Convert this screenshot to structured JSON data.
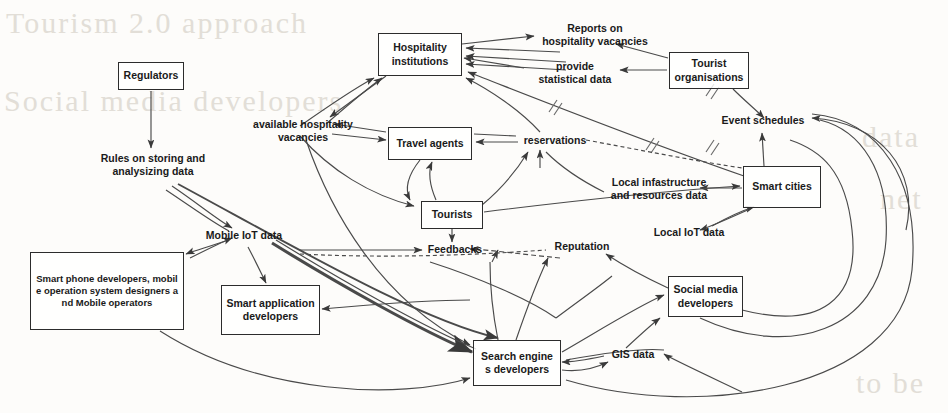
{
  "diagram": {
    "type": "node-link-diagram",
    "canvas": {
      "width": 948,
      "height": 413
    },
    "style": {
      "box_border": "#2c2c2c",
      "line_color": "#4a4a4a",
      "text_color": "#1a1a1a",
      "background": "#fdfcfa"
    },
    "nodes": [
      {
        "id": "regulators",
        "label": "Regulators",
        "x": 118,
        "y": 62,
        "w": 66,
        "h": 28
      },
      {
        "id": "hospitality",
        "label": "Hospitality\ninstitutions",
        "x": 378,
        "y": 33,
        "w": 84,
        "h": 43
      },
      {
        "id": "tourist_org",
        "label": "Tourist\norganisations",
        "x": 669,
        "y": 52,
        "w": 80,
        "h": 37
      },
      {
        "id": "travel",
        "label": "Travel agents",
        "x": 388,
        "y": 127,
        "w": 84,
        "h": 33
      },
      {
        "id": "tourists",
        "label": "Tourists",
        "x": 421,
        "y": 201,
        "w": 62,
        "h": 28
      },
      {
        "id": "smart_cities",
        "label": "Smart cities",
        "x": 743,
        "y": 166,
        "w": 78,
        "h": 42
      },
      {
        "id": "smartphone",
        "label": "Smart phone developers, mobil\ne operation system designers a\nnd Mobile operators",
        "x": 30,
        "y": 252,
        "w": 154,
        "h": 78
      },
      {
        "id": "smart_app",
        "label": "Smart application\ndevelopers",
        "x": 221,
        "y": 285,
        "w": 99,
        "h": 50
      },
      {
        "id": "social_media",
        "label": "Social media\ndevelopers",
        "x": 668,
        "y": 276,
        "w": 75,
        "h": 41
      },
      {
        "id": "search_eng",
        "label": "Search engine\ns developers",
        "x": 473,
        "y": 340,
        "w": 88,
        "h": 46
      }
    ],
    "flow_labels": [
      {
        "id": "reports",
        "text": "Reports on\nhospitality vacancies",
        "x": 532,
        "y": 22,
        "w": 126
      },
      {
        "id": "provide_stats",
        "text": "provide\nstatistical data",
        "x": 527,
        "y": 60,
        "w": 96
      },
      {
        "id": "avail_vac",
        "text": "available hospitality\nvacancies",
        "x": 240,
        "y": 118,
        "w": 126
      },
      {
        "id": "event_sched",
        "text": "Event schedules",
        "x": 718,
        "y": 114,
        "w": 90
      },
      {
        "id": "reservations",
        "text": "reservations",
        "x": 519,
        "y": 134,
        "w": 72
      },
      {
        "id": "rules",
        "text": "Rules on storing and\nanalysizing data",
        "x": 88,
        "y": 152,
        "w": 130
      },
      {
        "id": "local_infra",
        "text": "Local infastructure\nand resources data",
        "x": 600,
        "y": 176,
        "w": 118
      },
      {
        "id": "mobile_iot",
        "text": "Mobile IoT data",
        "x": 198,
        "y": 229,
        "w": 92
      },
      {
        "id": "local_iot",
        "text": "Local IoT data",
        "x": 646,
        "y": 226,
        "w": 86
      },
      {
        "id": "feedbacks",
        "text": "Feedbacks",
        "x": 425,
        "y": 243,
        "w": 60
      },
      {
        "id": "reputation",
        "text": "Reputation",
        "x": 550,
        "y": 240,
        "w": 64
      },
      {
        "id": "gis",
        "text": "GIS data",
        "x": 605,
        "y": 348,
        "w": 56
      }
    ],
    "ghost_text": [
      {
        "text": "Tourism 2.0 approach",
        "x": 6,
        "y": 12,
        "size": 30
      },
      {
        "text": "Social media developers",
        "x": 4,
        "y": 88,
        "size": 30
      },
      {
        "text": "data",
        "x": 862,
        "y": 126,
        "size": 30
      },
      {
        "text": "net",
        "x": 876,
        "y": 186,
        "size": 30
      },
      {
        "text": "to be",
        "x": 856,
        "y": 372,
        "size": 30
      }
    ]
  }
}
